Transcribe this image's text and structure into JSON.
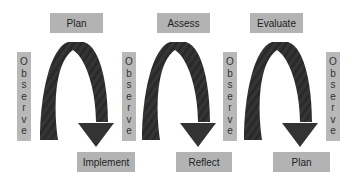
{
  "diagram": {
    "cycles": [
      {
        "top_label": "Plan",
        "bottom_label": "Implement"
      },
      {
        "top_label": "Assess",
        "bottom_label": "Reflect"
      },
      {
        "top_label": "Evaluate",
        "bottom_label": "Plan"
      }
    ],
    "side_label": "Observe",
    "side_label_letters": [
      "O",
      "b",
      "s",
      "e",
      "r",
      "v",
      "e"
    ],
    "colors": {
      "box": "#b3b3b3",
      "arrow": "#333333",
      "background": "#ffffff"
    }
  }
}
